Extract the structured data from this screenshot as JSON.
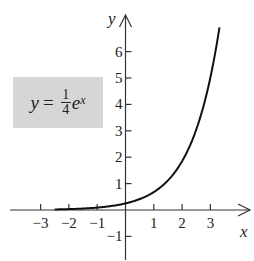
{
  "chart_data": {
    "type": "line",
    "title": "",
    "equation_label": {
      "lhs": "y",
      "equals": "=",
      "numerator": "1",
      "denominator": "4",
      "base": "e",
      "exponent": "x"
    },
    "function": "y = (1/4) e^x",
    "xlabel": "x",
    "ylabel": "y",
    "xlim": [
      -4,
      4.4
    ],
    "ylim": [
      -1.9,
      7.4
    ],
    "x_ticks": [
      -3,
      -2,
      -1,
      1,
      2,
      3
    ],
    "x_tick_labels": [
      "−3",
      "−2",
      "−1",
      "1",
      "2",
      "3"
    ],
    "y_ticks": [
      -1,
      1,
      2,
      3,
      4,
      5,
      6
    ],
    "y_tick_labels": [
      "−1",
      "1",
      "2",
      "3",
      "4",
      "5",
      "6"
    ],
    "grid": false,
    "legend": "none",
    "series": [
      {
        "name": "y = 1/4 e^x",
        "x_range": [
          -2.5,
          3.32
        ],
        "x": [
          -2.5,
          -2,
          -1.5,
          -1,
          -0.5,
          0,
          0.5,
          1,
          1.5,
          2,
          2.5,
          3,
          3.32
        ],
        "y": [
          0.02,
          0.03,
          0.06,
          0.09,
          0.15,
          0.25,
          0.41,
          0.68,
          1.12,
          1.85,
          3.05,
          5.02,
          6.91
        ],
        "color": "#111111"
      }
    ],
    "colors": {
      "axis": "#333333",
      "curve": "#111111",
      "label_box": "#d6d6d6"
    }
  }
}
